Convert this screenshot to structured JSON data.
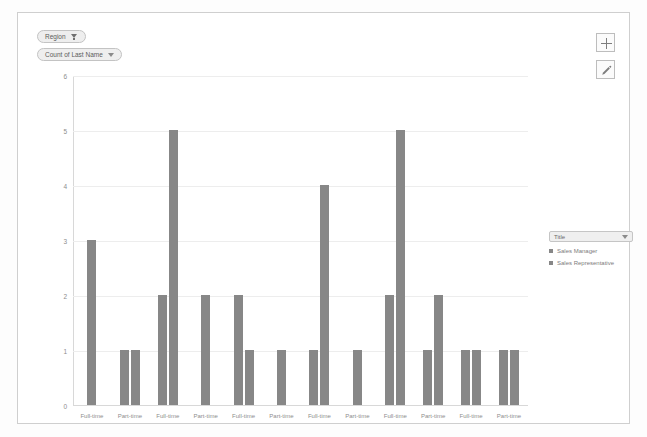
{
  "field_pills": {
    "region": {
      "label": "Region",
      "icon": "filter-funnel-icon"
    },
    "measure": {
      "label": "Count of Last Name",
      "icon": "chevron-down-icon"
    }
  },
  "toolbar": {
    "add_label": "+",
    "add_icon": "plus-icon",
    "edit_icon": "pencil-icon"
  },
  "legend": {
    "title": "Title",
    "caret_icon": "chevron-down-icon",
    "entries": [
      {
        "label": "Sales Manager",
        "color": "#878787"
      },
      {
        "label": "Sales Representative",
        "color": "#878787"
      }
    ]
  },
  "colors": {
    "bar": "#878787",
    "grid": "#ededed",
    "axis": "#d8d8d8",
    "text": "#8d8d8d",
    "frame": "#cfcfcf"
  },
  "chart_data": {
    "type": "bar",
    "title": "Count of Last Name",
    "xlabel": "",
    "ylabel": "Count of Last Name",
    "ylim": [
      0,
      6
    ],
    "yticks": [
      0,
      1,
      2,
      3,
      4,
      5,
      6
    ],
    "grid": true,
    "legend_position": "right",
    "categories": [
      "Full-time",
      "Part-time",
      "Full-time",
      "Part-time",
      "Full-time",
      "Part-time",
      "Full-time",
      "Part-time",
      "Full-time",
      "Part-time",
      "Full-time",
      "Part-time"
    ],
    "series": [
      {
        "name": "Sales Manager",
        "values": [
          3,
          1,
          2,
          2,
          2,
          1,
          1,
          1,
          2,
          1,
          1,
          1
        ]
      },
      {
        "name": "Sales Representative",
        "values": [
          null,
          1,
          5,
          null,
          1,
          null,
          4,
          null,
          5,
          2,
          1,
          1
        ]
      }
    ],
    "bars": [
      {
        "group": 1,
        "category": "Full-time",
        "series": "Sales Manager",
        "value": 3
      },
      {
        "group": 2,
        "category": "Part-time",
        "series": "Sales Manager",
        "value": 1
      },
      {
        "group": 2,
        "category": "Part-time",
        "series": "Sales Representative",
        "value": 1
      },
      {
        "group": 3,
        "category": "Full-time",
        "series": "Sales Manager",
        "value": 2
      },
      {
        "group": 3,
        "category": "Full-time",
        "series": "Sales Representative",
        "value": 5
      },
      {
        "group": 4,
        "category": "Part-time",
        "series": "Sales Manager",
        "value": 2
      },
      {
        "group": 5,
        "category": "Full-time",
        "series": "Sales Manager",
        "value": 2
      },
      {
        "group": 5,
        "category": "Full-time",
        "series": "Sales Representative",
        "value": 1
      },
      {
        "group": 6,
        "category": "Part-time",
        "series": "Sales Manager",
        "value": 1
      },
      {
        "group": 7,
        "category": "Full-time",
        "series": "Sales Manager",
        "value": 1
      },
      {
        "group": 7,
        "category": "Full-time",
        "series": "Sales Representative",
        "value": 4
      },
      {
        "group": 8,
        "category": "Part-time",
        "series": "Sales Manager",
        "value": 1
      },
      {
        "group": 9,
        "category": "Full-time",
        "series": "Sales Manager",
        "value": 2
      },
      {
        "group": 9,
        "category": "Full-time",
        "series": "Sales Representative",
        "value": 5
      },
      {
        "group": 10,
        "category": "Part-time",
        "series": "Sales Manager",
        "value": 1
      },
      {
        "group": 10,
        "category": "Part-time",
        "series": "Sales Representative",
        "value": 2
      },
      {
        "group": 11,
        "category": "Full-time",
        "series": "Sales Manager",
        "value": 1
      },
      {
        "group": 11,
        "category": "Full-time",
        "series": "Sales Representative",
        "value": 1
      },
      {
        "group": 12,
        "category": "Part-time",
        "series": "Sales Manager",
        "value": 1
      },
      {
        "group": 12,
        "category": "Part-time",
        "series": "Sales Representative",
        "value": 1
      }
    ]
  }
}
